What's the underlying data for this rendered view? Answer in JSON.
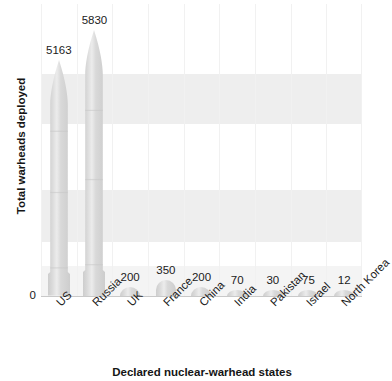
{
  "chart_data": {
    "type": "bar",
    "title": "",
    "xlabel": "Declared nuclear-warhead states",
    "ylabel": "Total warheads deployed",
    "categories": [
      "US",
      "Russia",
      "UK",
      "France",
      "China",
      "India",
      "Pakistan",
      "Israel",
      "North Korea"
    ],
    "values": [
      5163,
      5830,
      200,
      350,
      200,
      70,
      30,
      75,
      12
    ],
    "value_labels": [
      "5163",
      "5830",
      "200",
      "350",
      "200",
      "70",
      "30",
      "75",
      "12"
    ],
    "ylim": [
      0,
      6400
    ],
    "ytick_labels": [
      "0"
    ],
    "grid": "horizontal-bands-and-vertical-separators",
    "legend": "none",
    "bar_style": "missile-shaped",
    "colors": {
      "bar_fill": "#d9d9d9",
      "bar_highlight": "#ececec",
      "bar_shadow": "#cdcdcd",
      "background": "#ffffff",
      "band": "#eeeeee",
      "gridline": "#f1f1f1",
      "axis": "#c9c9c9",
      "text": "#1b1b1b"
    }
  }
}
